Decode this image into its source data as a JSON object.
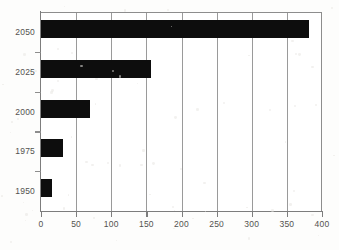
{
  "chart_data": {
    "type": "bar",
    "orientation": "horizontal",
    "title": "",
    "subtitle": "",
    "xlabel": "",
    "ylabel": "",
    "categories": [
      "1950",
      "1975",
      "2000",
      "2025",
      "2050"
    ],
    "values": [
      15,
      31,
      70,
      156,
      382
    ],
    "series": [
      {
        "name": "",
        "values": [
          15,
          31,
          70,
          156,
          382
        ]
      }
    ],
    "xlim": [
      0,
      400
    ],
    "ylim": null,
    "xticks": [
      0,
      50,
      100,
      150,
      200,
      250,
      300,
      350,
      400
    ],
    "xtick_labels": [
      "0",
      "50",
      "100",
      "150",
      "200",
      "250",
      "300",
      "350",
      "400"
    ],
    "ytick_labels": [
      "2050",
      "2025",
      "2000",
      "1975",
      "1950"
    ],
    "grid": {
      "vertical": true,
      "horizontal": false
    },
    "legend": {
      "visible": false,
      "position": "none",
      "entries": []
    },
    "annotations": [],
    "colors": {
      "bar": "#0d0d0d",
      "gridline": "#9a9a9a",
      "axis": "#7d7d7d",
      "tick_label": "#53524f",
      "plot_background": "#ffffff",
      "figure_background": "#fdfdfc"
    }
  }
}
